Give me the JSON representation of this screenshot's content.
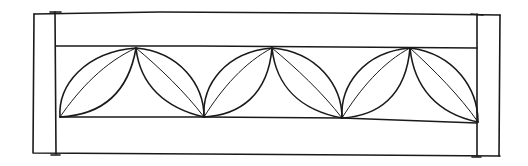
{
  "drawing": {
    "subject": "decorative border panel with interlocking leaf motif",
    "colors": {
      "ink": "#1a1a1a",
      "paper": "#ffffff"
    },
    "frame": {
      "outer": {
        "x1": 33,
        "y1": 13,
        "x2": 500,
        "y2": 154
      },
      "left_post_x": 55,
      "right_post_x": 477,
      "inner_band": {
        "top_y": 46,
        "bottom_y": 118
      }
    },
    "leaves": [
      {
        "base_x": 60,
        "base_y": 117,
        "apex_x": 136,
        "apex_y": 48,
        "direction": "up-right"
      },
      {
        "base_x": 204,
        "base_y": 117,
        "apex_x": 136,
        "apex_y": 48,
        "direction": "up-left"
      },
      {
        "base_x": 204,
        "base_y": 117,
        "apex_x": 272,
        "apex_y": 48,
        "direction": "up-right"
      },
      {
        "base_x": 342,
        "base_y": 118,
        "apex_x": 272,
        "apex_y": 48,
        "direction": "up-left"
      },
      {
        "base_x": 342,
        "base_y": 118,
        "apex_x": 410,
        "apex_y": 48,
        "direction": "up-right"
      },
      {
        "base_x": 478,
        "base_y": 122,
        "apex_x": 410,
        "apex_y": 48,
        "direction": "up-left"
      }
    ]
  }
}
